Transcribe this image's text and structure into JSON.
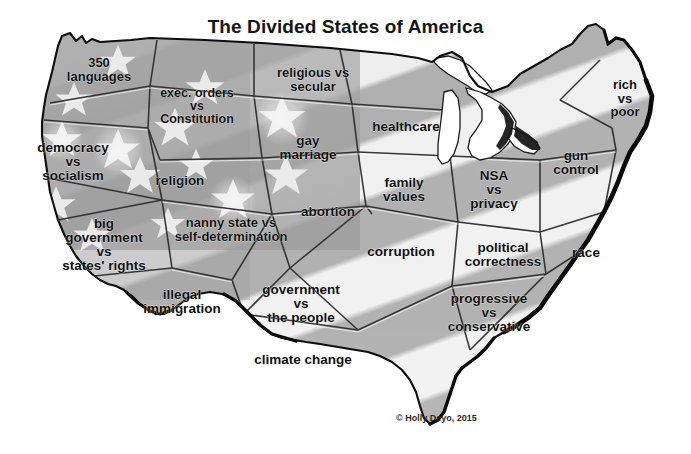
{
  "title": "The Divided States of America",
  "copyright": "© Holly Deyo, 2015",
  "colors": {
    "background": "#ffffff",
    "outline": "#0d0d0d",
    "state_light": "#e3e3e3",
    "state_mid": "#c3c3c3",
    "state_dark": "#a9a9a9",
    "star_white": "#f2f2f2",
    "text": "#101010",
    "lake_white": "#ffffff"
  },
  "map": {
    "alt": "Grayscale US flag-textured map of the United States divided into puzzle-like state pieces, each labeled with a divisive political issue",
    "labels": [
      {
        "id": "languages",
        "text": "350\nlanguages",
        "x": 99,
        "y": 70,
        "size": 13
      },
      {
        "id": "exec-orders",
        "text": "exec. orders\nvs\nConstitution",
        "x": 197,
        "y": 106,
        "size": 12.5
      },
      {
        "id": "religious-secular",
        "text": "religious vs\nsecular",
        "x": 313,
        "y": 80,
        "size": 13
      },
      {
        "id": "rich-poor",
        "text": "rich\nvs\npoor",
        "x": 625,
        "y": 98,
        "size": 13
      },
      {
        "id": "democracy",
        "text": "democracy\nvs\nsocialism",
        "x": 73,
        "y": 162,
        "size": 13.5
      },
      {
        "id": "healthcare",
        "text": "healthcare",
        "x": 406,
        "y": 127,
        "size": 13.5
      },
      {
        "id": "gay-marriage",
        "text": "gay\nmarriage",
        "x": 308,
        "y": 148,
        "size": 13.5
      },
      {
        "id": "religion",
        "text": "religion",
        "x": 180,
        "y": 181,
        "size": 13.5
      },
      {
        "id": "gun-control",
        "text": "gun\ncontrol",
        "x": 576,
        "y": 163,
        "size": 13.5
      },
      {
        "id": "nsa-privacy",
        "text": "NSA\nvs\nprivacy",
        "x": 494,
        "y": 190,
        "size": 13.5
      },
      {
        "id": "family-values",
        "text": "family\nvalues",
        "x": 404,
        "y": 190,
        "size": 13.5
      },
      {
        "id": "abortion",
        "text": "abortion",
        "x": 328,
        "y": 212,
        "size": 13.5
      },
      {
        "id": "nanny-state",
        "text": "nanny state vs\nself-determination",
        "x": 231,
        "y": 230,
        "size": 13
      },
      {
        "id": "big-government",
        "text": "big\ngovernment\nvs\nstates' rights",
        "x": 104,
        "y": 245,
        "size": 13.5
      },
      {
        "id": "corruption",
        "text": "corruption",
        "x": 401,
        "y": 252,
        "size": 13.5
      },
      {
        "id": "political-correctness",
        "text": "political\ncorrectness",
        "x": 503,
        "y": 255,
        "size": 13.5
      },
      {
        "id": "race",
        "text": "race",
        "x": 586,
        "y": 253,
        "size": 13.5
      },
      {
        "id": "illegal-immigration",
        "text": "illegal\nimmigration",
        "x": 182,
        "y": 302,
        "size": 13.5
      },
      {
        "id": "government-people",
        "text": "government\nvs\nthe people",
        "x": 301,
        "y": 304,
        "size": 13.5
      },
      {
        "id": "progressive",
        "text": "progressive\nvs\nconservative",
        "x": 489,
        "y": 313,
        "size": 13.5
      },
      {
        "id": "climate-change",
        "text": "climate change",
        "x": 303,
        "y": 360,
        "size": 13.5
      }
    ]
  }
}
